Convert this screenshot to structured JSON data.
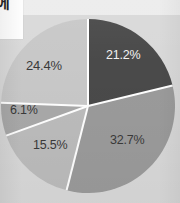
{
  "figure": {
    "background_color": "#d9d9d9",
    "corner_card": {
      "glyph": "에",
      "background_color": "#fdfdfd"
    },
    "top_strip_color": "#ececec"
  },
  "chart_data": {
    "type": "pie",
    "title": "",
    "subtitle": "",
    "xlabel": "",
    "ylabel": "",
    "grid": false,
    "legend": "none",
    "start_angle_deg": 0,
    "direction": "clockwise",
    "units": "percent",
    "categories": [
      "Segment 1",
      "Segment 2",
      "Segment 3",
      "Segment 4",
      "Segment 5"
    ],
    "values": [
      21.2,
      32.7,
      15.5,
      6.1,
      24.4
    ],
    "labels": [
      "21.2%",
      "32.7%",
      "15.5%",
      "6.1%",
      "24.4%"
    ],
    "colors": [
      "#4a4a4a",
      "#9b9b9b",
      "#bcbcbc",
      "#a9a9a9",
      "#c8c8c8"
    ],
    "label_colors": [
      "#f2f2f2",
      "#3a3a3a",
      "#3a3a3a",
      "#3a3a3a",
      "#3a3a3a"
    ],
    "separator_color": "#ffffff",
    "separator_width_px": 2,
    "slices": [
      {
        "label": "21.2%",
        "value": 21.2,
        "color": "#4a4a4a",
        "label_color": "#f2f2f2"
      },
      {
        "label": "32.7%",
        "value": 32.7,
        "color": "#9b9b9b",
        "label_color": "#3a3a3a"
      },
      {
        "label": "15.5%",
        "value": 15.5,
        "color": "#bcbcbc",
        "label_color": "#3a3a3a"
      },
      {
        "label": "6.1%",
        "value": 6.1,
        "color": "#a9a9a9",
        "label_color": "#3a3a3a"
      },
      {
        "label": "24.4%",
        "value": 24.4,
        "color": "#c8c8c8",
        "label_color": "#3a3a3a"
      }
    ]
  }
}
